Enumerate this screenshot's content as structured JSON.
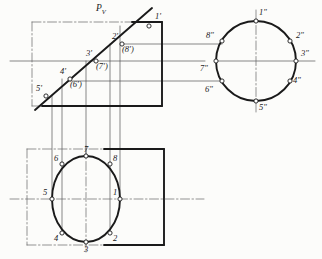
{
  "drawing": {
    "title": "Descriptive geometry: cylinder truncated by inclined plane",
    "cutting_plane_label": "P",
    "cutting_plane_sub": "V",
    "colors": {
      "outline": "#1a1a1a",
      "thin_line": "#555555",
      "center_line": "#666666",
      "label": "#1a1a1a",
      "paper": "#fcfcfa"
    }
  },
  "front_view": {
    "name": "front-view",
    "rect": {
      "x": 32,
      "y": 22,
      "w": 130,
      "h": 84
    },
    "cut_line": {
      "x1": 35,
      "y1": 110,
      "x2": 152,
      "y2": 8
    },
    "points": [
      {
        "id": "1p",
        "label": "1'",
        "x": 149,
        "y": 26,
        "lx": 155,
        "ly": 12
      },
      {
        "id": "2p",
        "label": "2'",
        "x": 122,
        "y": 44,
        "lx": 112,
        "ly": 32
      },
      {
        "id": "8p",
        "label": "(8')",
        "x": 122,
        "y": 44,
        "lx": 122,
        "ly": 45
      },
      {
        "id": "3p",
        "label": "3'",
        "x": 96,
        "y": 61,
        "lx": 86,
        "ly": 49
      },
      {
        "id": "7p",
        "label": "(7')",
        "x": 96,
        "y": 61,
        "lx": 96,
        "ly": 62
      },
      {
        "id": "4p",
        "label": "4'",
        "x": 70,
        "y": 79,
        "lx": 60,
        "ly": 67
      },
      {
        "id": "6p",
        "label": "(6')",
        "x": 70,
        "y": 79,
        "lx": 70,
        "ly": 80
      },
      {
        "id": "5p",
        "label": "5'",
        "x": 46,
        "y": 96,
        "lx": 36,
        "ly": 84
      }
    ]
  },
  "side_view": {
    "name": "side-view",
    "circle": {
      "cx": 256,
      "cy": 61,
      "r": 40
    },
    "points": [
      {
        "id": "1pp",
        "label": "1\"",
        "x": 256,
        "y": 21,
        "lx": 259,
        "ly": 8
      },
      {
        "id": "2pp",
        "label": "2\"",
        "x": 290,
        "y": 41,
        "lx": 296,
        "ly": 31
      },
      {
        "id": "3pp",
        "label": "3\"",
        "x": 296,
        "y": 61,
        "lx": 301,
        "ly": 49
      },
      {
        "id": "4pp",
        "label": "4\"",
        "x": 290,
        "y": 81,
        "lx": 293,
        "ly": 76
      },
      {
        "id": "5pp",
        "label": "5\"",
        "x": 256,
        "y": 101,
        "lx": 259,
        "ly": 103
      },
      {
        "id": "6pp",
        "label": "6\"",
        "x": 222,
        "y": 81,
        "lx": 205,
        "ly": 85
      },
      {
        "id": "7pp",
        "label": "7\"",
        "x": 216,
        "y": 61,
        "lx": 200,
        "ly": 64
      },
      {
        "id": "8pp",
        "label": "8\"",
        "x": 222,
        "y": 41,
        "lx": 206,
        "ly": 31
      }
    ]
  },
  "top_view": {
    "name": "top-view",
    "rect": {
      "x": 27,
      "y": 149,
      "w": 137,
      "h": 96
    },
    "ellipse": {
      "cx": 86,
      "cy": 199,
      "rx": 34,
      "ry": 43
    },
    "points": [
      {
        "id": "1",
        "label": "1",
        "x": 120,
        "y": 199,
        "lx": 113,
        "ly": 188
      },
      {
        "id": "2",
        "label": "2",
        "x": 110,
        "y": 233,
        "lx": 113,
        "ly": 234
      },
      {
        "id": "3",
        "label": "3",
        "x": 86,
        "y": 242,
        "lx": 84,
        "ly": 245
      },
      {
        "id": "4",
        "label": "4",
        "x": 62,
        "y": 233,
        "lx": 54,
        "ly": 234
      },
      {
        "id": "5",
        "label": "5",
        "x": 52,
        "y": 199,
        "lx": 43,
        "ly": 188
      },
      {
        "id": "6",
        "label": "6",
        "x": 62,
        "y": 164,
        "lx": 54,
        "ly": 154
      },
      {
        "id": "7",
        "label": "7",
        "x": 86,
        "y": 156,
        "lx": 84,
        "ly": 145
      },
      {
        "id": "8",
        "label": "8",
        "x": 110,
        "y": 164,
        "lx": 113,
        "ly": 154
      }
    ]
  },
  "projection_lines": {
    "horizontal": [
      {
        "y": 44,
        "x1": 122,
        "x2": 222
      },
      {
        "y": 61,
        "x1": 10,
        "x2": 205
      },
      {
        "y": 61,
        "x1": 216,
        "x2": 315
      },
      {
        "y": 81,
        "x1": 70,
        "x2": 222
      }
    ],
    "vertical": [
      {
        "x": 52,
        "y1": 96,
        "y2": 199
      },
      {
        "x": 62,
        "y1": 79,
        "y2": 233
      },
      {
        "x": 86,
        "y1": 61,
        "y2": 156
      },
      {
        "x": 110,
        "y1": 44,
        "y2": 233
      },
      {
        "x": 120,
        "y1": 26,
        "y2": 199
      }
    ]
  }
}
